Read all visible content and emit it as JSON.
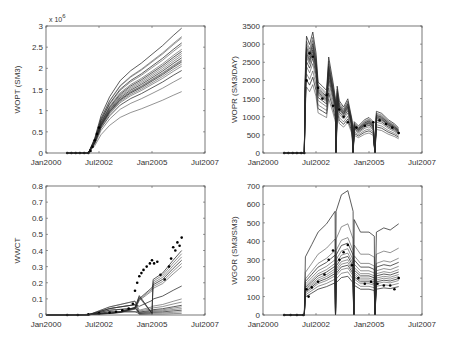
{
  "figure": {
    "width": 449,
    "height": 343,
    "colors": {
      "frame": "#555555",
      "line": "#2a2a2a",
      "obs": "#000000",
      "tick_text": "#333333"
    }
  },
  "chart_data": [
    {
      "id": "wopt",
      "type": "line",
      "title": "",
      "xlabel": "",
      "ylabel": "WOPT (SM3)",
      "y_multiplier_label": "x 10",
      "y_multiplier_exp": "6",
      "frame": {
        "x0": 46,
        "y0": 26,
        "x1": 205,
        "y1": 153
      },
      "xlim": [
        0,
        7.5
      ],
      "ylim": [
        0,
        3
      ],
      "xticks": [
        0,
        2.5,
        5,
        7.5
      ],
      "xtick_labels": [
        "Jan2000",
        "Jul2002",
        "Jan2005",
        "Jul2007"
      ],
      "yticks": [
        0,
        0.5,
        1,
        1.5,
        2,
        2.5,
        3
      ],
      "ytick_labels": [
        "0",
        "0.5",
        "1",
        "1.5",
        "2",
        "2.5",
        "3"
      ],
      "grid": false,
      "legend": null,
      "ensemble": {
        "x": [
          1.0,
          1.5,
          2.0,
          2.3,
          2.6,
          3.0,
          3.5,
          4.0,
          4.5,
          5.0,
          5.5,
          6.0,
          6.4
        ],
        "members_final": [
          2.95,
          2.75,
          2.72,
          2.6,
          2.55,
          2.45,
          2.4,
          2.35,
          2.3,
          2.25,
          2.2,
          2.18,
          2.15,
          2.1,
          2.05,
          1.95,
          1.78,
          1.45
        ],
        "shape": [
          0,
          0,
          0,
          0.12,
          0.3,
          0.45,
          0.58,
          0.66,
          0.72,
          0.79,
          0.86,
          0.94,
          1.0
        ]
      },
      "observed": {
        "x": [
          1.0,
          1.2,
          1.4,
          1.6,
          1.8,
          2.0,
          2.1,
          2.2,
          2.3,
          2.4,
          2.5
        ],
        "y": [
          0,
          0,
          0,
          0,
          0,
          0,
          0.05,
          0.15,
          0.3,
          0.45,
          0.6
        ]
      }
    },
    {
      "id": "wopr",
      "type": "line",
      "title": "",
      "xlabel": "",
      "ylabel": "WOPR (SM3/DAY)",
      "frame": {
        "x0": 263,
        "y0": 26,
        "x1": 422,
        "y1": 153
      },
      "xlim": [
        0,
        7.5
      ],
      "ylim": [
        0,
        3500
      ],
      "xticks": [
        0,
        2.5,
        5,
        7.5
      ],
      "xtick_labels": [
        "Jan2000",
        "Jul2002",
        "Jan2005",
        "Jul2007"
      ],
      "yticks": [
        0,
        500,
        1000,
        1500,
        2000,
        2500,
        3000,
        3500
      ],
      "ytick_labels": [
        "0",
        "500",
        "1000",
        "1500",
        "2000",
        "2500",
        "3000",
        "3500"
      ],
      "grid": false,
      "legend": null,
      "ensemble": {
        "x": [
          1.0,
          1.95,
          2.0,
          2.05,
          2.2,
          2.35,
          2.5,
          2.6,
          2.8,
          3.0,
          3.1,
          3.3,
          3.42,
          3.45,
          3.5,
          3.6,
          3.8,
          4.0,
          4.2,
          4.25,
          4.3,
          4.5,
          4.8,
          5.0,
          5.2,
          5.28,
          5.35,
          5.6,
          5.9,
          6.2,
          6.4
        ],
        "center": [
          0,
          0,
          2000,
          2800,
          2600,
          2900,
          2400,
          1700,
          1600,
          1500,
          2300,
          1700,
          1300,
          0,
          1600,
          1250,
          1100,
          1300,
          800,
          0,
          750,
          650,
          800,
          850,
          750,
          0,
          1000,
          950,
          800,
          700,
          600
        ],
        "scales": [
          1.15,
          1.1,
          1.07,
          1.04,
          1.02,
          1.0,
          0.98,
          0.96,
          0.94,
          0.9,
          0.85,
          0.78,
          0.72,
          0.65
        ]
      },
      "observed": {
        "x": [
          1.0,
          1.2,
          1.4,
          1.6,
          1.8,
          1.95,
          2.05,
          2.2,
          2.35,
          2.6,
          2.8,
          3.0,
          3.3,
          3.6,
          3.8,
          4.0,
          4.4,
          4.8,
          5.2,
          5.5,
          5.8,
          6.1,
          6.4
        ],
        "y": [
          0,
          0,
          0,
          0,
          0,
          0,
          2000,
          2750,
          2650,
          1800,
          1500,
          1600,
          1300,
          1200,
          1000,
          850,
          700,
          750,
          850,
          900,
          800,
          700,
          550
        ]
      }
    },
    {
      "id": "wwct",
      "type": "line",
      "title": "",
      "xlabel": "",
      "ylabel": "WWCT",
      "frame": {
        "x0": 46,
        "y0": 186,
        "x1": 205,
        "y1": 315
      },
      "xlim": [
        0,
        7.5
      ],
      "ylim": [
        0,
        0.8
      ],
      "xticks": [
        0,
        2.5,
        5,
        7.5
      ],
      "xtick_labels": [
        "Jan2000",
        "Jul2002",
        "Jan2005",
        "Jul2007"
      ],
      "yticks": [
        0,
        0.1,
        0.2,
        0.3,
        0.4,
        0.5,
        0.6,
        0.7,
        0.8
      ],
      "ytick_labels": [
        "0",
        "0.1",
        "0.2",
        "0.3",
        "0.4",
        "0.5",
        "0.6",
        "0.7",
        "0.8"
      ],
      "grid": false,
      "legend": null,
      "ensemble": {
        "x": [
          0,
          1.0,
          2.0,
          3.0,
          3.5,
          4.2,
          4.4,
          5.0,
          5.05,
          5.5,
          6.0,
          6.4
        ],
        "upper_finals": [
          0.4,
          0.38,
          0.36,
          0.34,
          0.32,
          0.3,
          0.18,
          0.1,
          0.08,
          0.06,
          0.05,
          0.04,
          0.03,
          0.02,
          0.01
        ],
        "shape": [
          0,
          0,
          0.01,
          0.03,
          0.05,
          0.12,
          0.3,
          0.5,
          0.55,
          0.65,
          0.85,
          1.0
        ]
      },
      "observed": {
        "x": [
          1.0,
          1.5,
          2.0,
          2.5,
          3.0,
          3.3,
          3.6,
          3.9,
          4.1,
          4.2,
          4.3,
          4.4,
          4.5,
          4.6,
          4.75,
          4.9,
          5.0,
          5.1,
          5.25,
          5.4,
          5.6,
          5.8,
          5.9,
          6.0,
          6.1,
          6.2,
          6.3,
          6.4
        ],
        "y": [
          0,
          0,
          0.005,
          0.01,
          0.015,
          0.02,
          0.03,
          0.04,
          0.07,
          0.15,
          0.2,
          0.24,
          0.26,
          0.28,
          0.3,
          0.32,
          0.34,
          0.32,
          0.33,
          0.25,
          0.22,
          0.3,
          0.35,
          0.42,
          0.4,
          0.45,
          0.43,
          0.48
        ]
      }
    },
    {
      "id": "wgor",
      "type": "line",
      "title": "",
      "xlabel": "",
      "ylabel": "WGOR (SM3/SM3)",
      "frame": {
        "x0": 263,
        "y0": 186,
        "x1": 422,
        "y1": 315
      },
      "xlim": [
        0,
        7.5
      ],
      "ylim": [
        0,
        700
      ],
      "xticks": [
        0,
        2.5,
        5,
        7.5
      ],
      "xtick_labels": [
        "Jan2000",
        "Jul2002",
        "Jan2005",
        "Jul2007"
      ],
      "yticks": [
        0,
        100,
        200,
        300,
        400,
        500,
        600,
        700
      ],
      "ytick_labels": [
        "0",
        "100",
        "200",
        "300",
        "400",
        "500",
        "600",
        "700"
      ],
      "grid": false,
      "legend": null,
      "ensemble": {
        "x": [
          1.0,
          1.95,
          2.0,
          2.3,
          2.6,
          3.0,
          3.4,
          3.42,
          3.45,
          3.7,
          4.0,
          4.25,
          4.28,
          4.3,
          4.6,
          5.0,
          5.25,
          5.28,
          5.35,
          5.7,
          6.0,
          6.4
        ],
        "center": [
          0,
          0,
          140,
          170,
          200,
          220,
          250,
          0,
          250,
          290,
          300,
          250,
          0,
          230,
          200,
          200,
          190,
          0,
          200,
          210,
          205,
          220
        ],
        "scales": [
          2.25,
          1.65,
          1.4,
          1.3,
          1.2,
          1.12,
          1.06,
          1.0,
          0.95,
          0.9,
          0.85,
          0.78,
          0.7
        ]
      },
      "observed": {
        "x": [
          1.0,
          1.3,
          1.6,
          1.9,
          2.05,
          2.15,
          2.3,
          2.6,
          2.9,
          3.1,
          3.3,
          3.6,
          3.8,
          4.0,
          4.2,
          4.5,
          4.8,
          5.1,
          5.4,
          5.7,
          6.0,
          6.2,
          6.4
        ],
        "y": [
          0,
          0,
          0,
          0,
          140,
          100,
          150,
          180,
          220,
          300,
          350,
          300,
          340,
          380,
          270,
          200,
          170,
          180,
          170,
          160,
          160,
          140,
          200
        ]
      }
    }
  ]
}
